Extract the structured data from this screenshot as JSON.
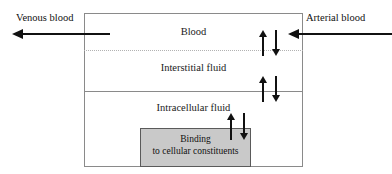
{
  "diagram": {
    "colors": {
      "box_border": "#8a8a8a",
      "binding_fill": "#c9c9c9",
      "binding_border": "#5a5a5a",
      "arrow": "#111111",
      "dotted_separator": "#b2b2b2",
      "background": "#ffffff"
    },
    "compartments": [
      {
        "id": "blood",
        "label": "Blood"
      },
      {
        "id": "interstitial",
        "label": "Interstitial fluid"
      },
      {
        "id": "intracellular",
        "label": "Intracellular fluid"
      }
    ],
    "binding_box": {
      "line1": "Binding",
      "line2": "to cellular constituents"
    },
    "flows": [
      {
        "id": "venous",
        "label": "Venous blood",
        "direction": "left-out"
      },
      {
        "id": "arterial",
        "label": "Arterial blood",
        "direction": "left-in"
      }
    ],
    "exchanges": [
      {
        "id": "blood-interstitial",
        "across": "Blood / Interstitial fluid boundary",
        "arrows": "up-down"
      },
      {
        "id": "interstitial-intracellular",
        "across": "Interstitial fluid / Intracellular fluid boundary",
        "arrows": "up-down"
      },
      {
        "id": "intracellular-binding",
        "across": "Intracellular fluid / Binding box boundary",
        "arrows": "up-down"
      }
    ]
  }
}
